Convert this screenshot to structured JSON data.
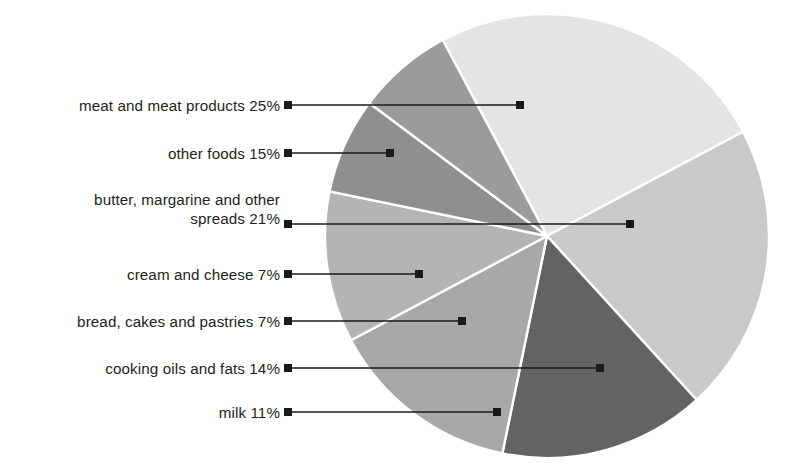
{
  "chart_data": {
    "type": "pie",
    "title": "",
    "xlabel": "",
    "ylabel": "",
    "legend_position": "callout-labels-left",
    "grid": false,
    "unit": "%",
    "total": 100,
    "center": {
      "x": 547,
      "y": 236
    },
    "radius": 222,
    "start_angle_deg": -28,
    "categories": [
      "meat and meat products",
      "butter, margarine and other spreads",
      "other foods",
      "cooking oils and fats",
      "milk",
      "cream and cheese",
      "bread, cakes and pastries"
    ],
    "values": [
      25,
      21,
      15,
      14,
      11,
      7,
      7
    ],
    "slices": [
      {
        "label": "meat and meat products",
        "value": 25,
        "display": "25%",
        "color": "#e4e4e4"
      },
      {
        "label": "butter, margarine and other spreads",
        "value": 21,
        "display": "21%",
        "color": "#c9c9c9"
      },
      {
        "label": "other foods",
        "value": 15,
        "display": "15%",
        "color": "#636363"
      },
      {
        "label": "cooking oils and fats",
        "value": 14,
        "display": "14%",
        "color": "#a8a8a8"
      },
      {
        "label": "milk",
        "value": 11,
        "display": "11%",
        "color": "#b4b4b4"
      },
      {
        "label": "cream and cheese",
        "value": 7,
        "display": "7%",
        "color": "#8f8f8f"
      },
      {
        "label": "bread, cakes and pastries",
        "value": 7,
        "display": "7%",
        "color": "#9b9b9b"
      }
    ]
  },
  "callouts": [
    {
      "name": "meat-and-meat-products",
      "text": "meat and meat products 25%",
      "text_right": 280,
      "text_y": 105,
      "line_y": 105,
      "line_x1": 288,
      "line_x2": 520
    },
    {
      "name": "other-foods",
      "text": "other foods 15%",
      "text_right": 280,
      "text_y": 153,
      "line_y": 153,
      "line_x1": 288,
      "line_x2": 390
    },
    {
      "name": "butter-margarine-and-other-spreads",
      "text": "butter, margarine and other\nspreads 21%",
      "text_right": 280,
      "text_y": 209,
      "line_y": 224,
      "line_x1": 288,
      "line_x2": 630
    },
    {
      "name": "cream-and-cheese",
      "text": "cream and cheese 7%",
      "text_right": 280,
      "text_y": 274,
      "line_y": 274,
      "line_x1": 288,
      "line_x2": 419
    },
    {
      "name": "bread-cakes-and-pastries",
      "text": "bread, cakes and pastries 7%",
      "text_right": 280,
      "text_y": 321,
      "line_y": 321,
      "line_x1": 288,
      "line_x2": 462
    },
    {
      "name": "cooking-oils-and-fats",
      "text": "cooking oils and fats 14%",
      "text_right": 280,
      "text_y": 368,
      "line_y": 368,
      "line_x1": 288,
      "line_x2": 600
    },
    {
      "name": "milk",
      "text": "milk 11%",
      "text_right": 280,
      "text_y": 412,
      "line_y": 412,
      "line_x1": 288,
      "line_x2": 497
    }
  ],
  "style": {
    "background": "#ffffff",
    "text_color": "#231f20",
    "leader_color": "#1a1a1a",
    "slice_divider": "#ffffff"
  }
}
